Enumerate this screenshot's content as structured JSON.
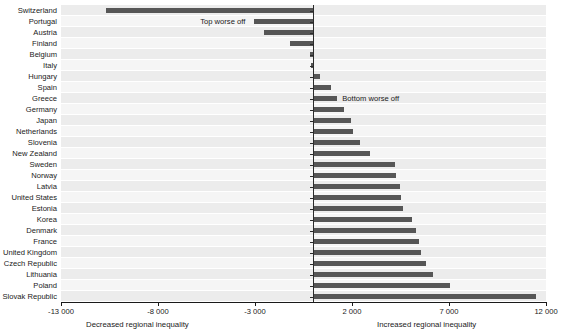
{
  "chart_data": {
    "type": "bar",
    "orientation": "horizontal",
    "title": "",
    "subtitle": "",
    "xlabel": "",
    "ylabel": "",
    "xlim": [
      -13000,
      12000
    ],
    "grid": false,
    "legend_position": "none",
    "bar_color": "#565656",
    "categories": [
      "Switzerland",
      "Portugal",
      "Austria",
      "Finland",
      "Belgium",
      "Italy",
      "Hungary",
      "Spain",
      "Greece",
      "Germany",
      "Japan",
      "Netherlands",
      "Slovenia",
      "New Zealand",
      "Sweden",
      "Norway",
      "Latvia",
      "United States",
      "Estonia",
      "Korea",
      "Denmark",
      "France",
      "United Kingdom",
      "Czech Republic",
      "Lithuania",
      "Poland",
      "Slovak Republic"
    ],
    "values": [
      -10700,
      -3050,
      -2530,
      -1220,
      -150,
      -120,
      350,
      900,
      1250,
      1600,
      1950,
      2050,
      2400,
      2950,
      4200,
      4250,
      4500,
      4550,
      4650,
      5100,
      5300,
      5450,
      5550,
      5800,
      6200,
      7050,
      11500
    ],
    "xticks": [
      -13000,
      -8000,
      -3000,
      2000,
      7000,
      12000
    ],
    "xtick_labels": [
      "-13 000",
      "-8 000",
      "-3 000",
      "2 000",
      "7 000",
      "12 000"
    ],
    "annotations": [
      {
        "text": "Top worse off",
        "x": -3500,
        "category": "Portugal"
      },
      {
        "text": "Bottom worse off",
        "x": 1500,
        "category": "Greece"
      }
    ],
    "axis_captions": {
      "left": "Decreased regional inequality",
      "right": "Increased regional inequality"
    }
  }
}
